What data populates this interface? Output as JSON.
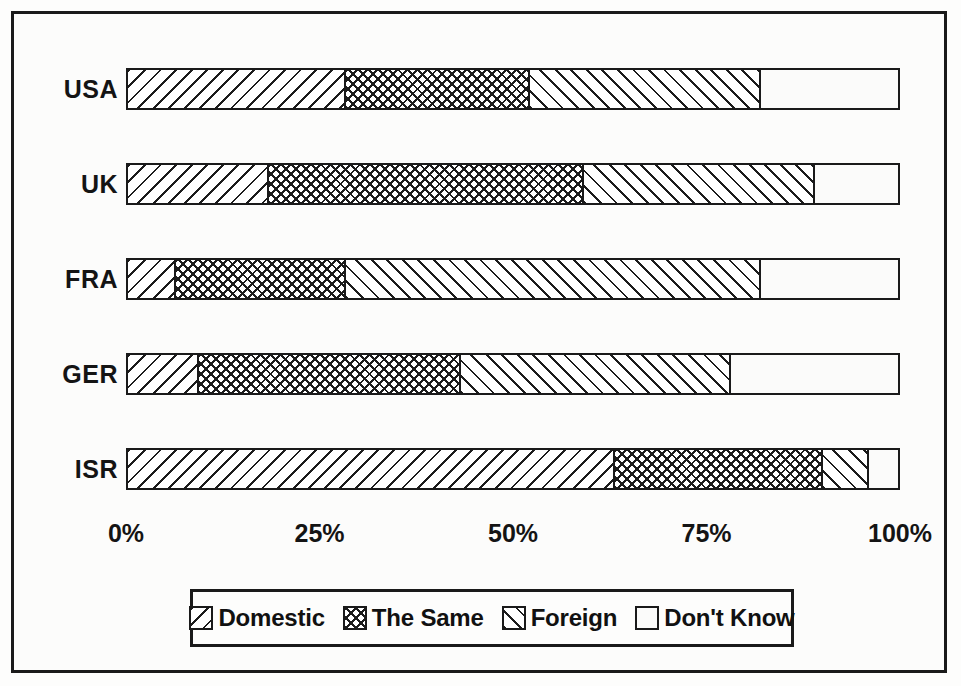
{
  "chart_data": {
    "type": "bar",
    "subtype": "stacked-horizontal-100",
    "title": "",
    "xlabel": "",
    "ylabel": "",
    "grid": false,
    "legend_position": "bottom",
    "xlim": [
      0,
      100
    ],
    "categories": [
      "USA",
      "UK",
      "FRA",
      "GER",
      "ISR"
    ],
    "tick_labels": [
      "0%",
      "25%",
      "50%",
      "75%",
      "100%"
    ],
    "tick_values": [
      0,
      25,
      50,
      75,
      100
    ],
    "series": [
      {
        "name": "Domestic",
        "pattern": "backslash-hatch",
        "values": [
          28,
          18,
          6,
          9,
          63
        ]
      },
      {
        "name": "The Same",
        "pattern": "cross-hatch",
        "values": [
          24,
          41,
          22,
          34,
          27
        ]
      },
      {
        "name": "Foreign",
        "pattern": "forward-hatch",
        "values": [
          30,
          30,
          54,
          35,
          6
        ]
      },
      {
        "name": "Don't Know",
        "pattern": "solid-white",
        "values": [
          18,
          11,
          18,
          22,
          4
        ]
      }
    ]
  },
  "legend": {
    "items": [
      {
        "label": "Domestic",
        "pattern": "backslash-hatch"
      },
      {
        "label": "The Same",
        "pattern": "cross-hatch"
      },
      {
        "label": "Foreign",
        "pattern": "forward-hatch"
      },
      {
        "label": "Don't Know",
        "pattern": "solid-white"
      }
    ]
  },
  "colors": {
    "ink": "#1a1a1a",
    "background": "#fdfdfc",
    "hatch": "#1c1c1c"
  }
}
